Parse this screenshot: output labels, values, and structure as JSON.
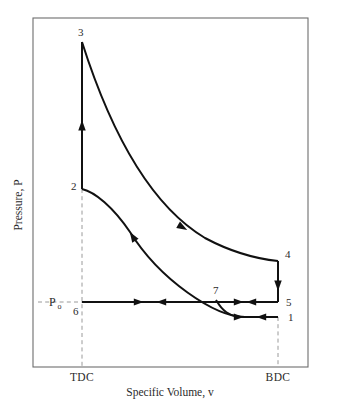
{
  "figure": {
    "kind": "pressure-volume-cycle-diagram",
    "background_color": "#ffffff",
    "ink_color": "#111111",
    "frame_color": "#6d6d6d",
    "guide_color": "#9a9a9a"
  },
  "axes": {
    "y_title": "Pressure, P",
    "x_title": "Specific Volume, v",
    "x_ticks": [
      {
        "label": "TDC",
        "x": 82
      },
      {
        "label": "BDC",
        "x": 278
      }
    ],
    "y_reference": {
      "symbol": "P",
      "subscript": "o",
      "y": 302
    },
    "frame": {
      "left": 33,
      "top": 18,
      "right": 308,
      "bottom": 367
    }
  },
  "states": [
    {
      "id": "1",
      "label": "1",
      "x": 278,
      "y": 317,
      "label_x": 288,
      "label_y": 321
    },
    {
      "id": "2",
      "label": "2",
      "x": 82,
      "y": 189,
      "label_x": 71,
      "label_y": 190
    },
    {
      "id": "3",
      "label": "3",
      "x": 82,
      "y": 42,
      "label_x": 78,
      "label_y": 36
    },
    {
      "id": "4",
      "label": "4",
      "x": 278,
      "y": 261,
      "label_x": 285,
      "label_y": 258
    },
    {
      "id": "5",
      "label": "5",
      "x": 278,
      "y": 302,
      "label_x": 286,
      "label_y": 306
    },
    {
      "id": "6",
      "label": "6",
      "x": 82,
      "y": 302,
      "label_x": 73,
      "label_y": 315
    },
    {
      "id": "7",
      "label": "7",
      "x": 216,
      "y": 300,
      "label_x": 213,
      "label_y": 294
    }
  ],
  "processes": [
    {
      "name": "compression-2-to-3",
      "from": "2",
      "to": "3",
      "shape": "vertical-line",
      "direction": "up",
      "path": "M 82 189 L 82 42"
    },
    {
      "name": "expansion-3-to-4",
      "from": "3",
      "to": "4",
      "shape": "curve",
      "direction": "down-right",
      "path": "M 82 42 C 110 130, 150 205, 205 238 C 235 254, 258 259, 278 261"
    },
    {
      "name": "blowdown-4-to-5",
      "from": "4",
      "to": "5",
      "shape": "vertical-line",
      "direction": "down",
      "path": "M 278 261 L 278 302"
    },
    {
      "name": "exhaust-5-to-6",
      "from": "5",
      "to": "6",
      "shape": "horizontal-line",
      "direction": "left",
      "path": "M 278 302 L 82 302"
    },
    {
      "name": "intake-6-to-1",
      "from": "6",
      "to": "1",
      "shape": "horizontal-line",
      "direction": "right",
      "path": "M 82 302 L 278 302"
    },
    {
      "name": "compression-1-to-2",
      "from": "1",
      "to": "2",
      "shape": "curve",
      "direction": "up-left",
      "path": "M 278 317 L 245 317 C 215 317, 160 280, 130 232 C 113 207, 95 192, 82 189"
    },
    {
      "name": "intake-branch-to-1",
      "from": "7",
      "to": "1",
      "shape": "curve-branch",
      "direction": "right",
      "path": "M 278 317 L 245 317 C 228 317, 222 310, 216 300"
    }
  ],
  "arrow_markers": [
    {
      "name": "arrow-2-to-3",
      "x": 82,
      "y": 126,
      "angle": -90,
      "size": 6.0
    },
    {
      "name": "arrow-3-to-4",
      "x": 182,
      "y": 227,
      "angle": 30,
      "size": 6.0
    },
    {
      "name": "arrow-4-to-5",
      "x": 278,
      "y": 285,
      "angle": 90,
      "size": 6.0
    },
    {
      "name": "arrow-5-to-6-left-a",
      "x": 162,
      "y": 302,
      "angle": 180,
      "size": 5.6
    },
    {
      "name": "arrow-5-to-6-left-b",
      "x": 252,
      "y": 302,
      "angle": 180,
      "size": 5.6
    },
    {
      "name": "arrow-6-to-1-right-a",
      "x": 138,
      "y": 302,
      "angle": 0,
      "size": 5.6
    },
    {
      "name": "arrow-6-to-1-right-b",
      "x": 238,
      "y": 302,
      "angle": 0,
      "size": 5.6
    },
    {
      "name": "arrow-1-to-2-curve",
      "x": 133,
      "y": 237,
      "angle": -122,
      "size": 6.0
    },
    {
      "name": "arrow-intake-branch-right",
      "x": 238,
      "y": 317,
      "angle": 0,
      "size": 5.6
    },
    {
      "name": "arrow-intake-branch-left",
      "x": 262,
      "y": 317,
      "angle": 180,
      "size": 5.6
    }
  ]
}
